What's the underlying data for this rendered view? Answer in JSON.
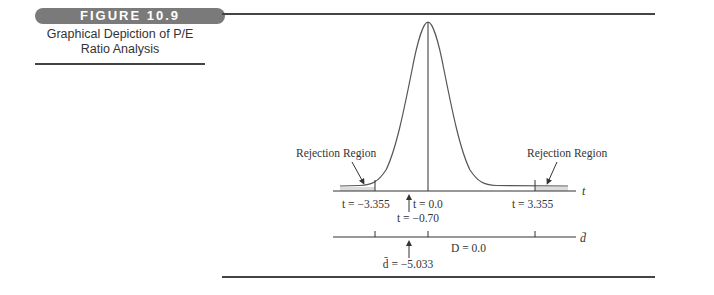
{
  "figure": {
    "label": "FIGURE 10.9",
    "caption_line1": "Graphical Depiction of P/E",
    "caption_line2": "Ratio Analysis"
  },
  "diagram": {
    "left_region_label": "Rejection Region",
    "right_region_label": "Rejection Region",
    "t_axis_label": "t",
    "d_axis_label": "d̄",
    "t_left_critical": "t = −3.355",
    "t_center": "t = 0.0",
    "t_observed": "t = −0.70",
    "t_right_critical": "t = 3.355",
    "d_center": "D = 0.0",
    "d_observed": "d̄ = −5.033"
  },
  "colors": {
    "badge": "#7a7a7a",
    "rule": "#444444",
    "curve": "#555555",
    "shade": "#d9d9d9"
  }
}
